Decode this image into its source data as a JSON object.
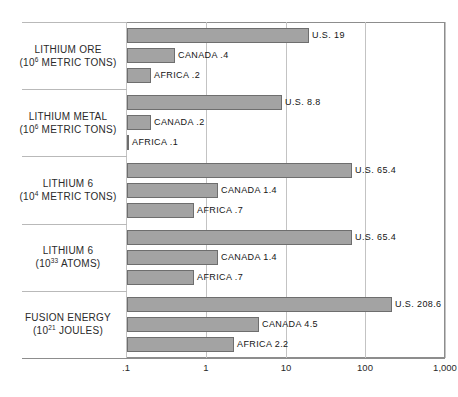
{
  "chart_data": {
    "type": "bar",
    "orientation": "horizontal",
    "title": "",
    "xlabel": "",
    "ylabel": "",
    "xscale": "log",
    "xlim": [
      0.1,
      1000
    ],
    "xticks": [
      0.1,
      1,
      10,
      100,
      1000
    ],
    "xticklabels": [
      ".1",
      "1",
      "10",
      "100",
      "1,000"
    ],
    "grid": true,
    "legend": "none",
    "bar_color": "#a3a3a3",
    "bar_edge_color": "#6e6e6e",
    "groups": [
      {
        "label_line1": "LITHIUM ORE",
        "label_line2_pre": "(10",
        "label_line2_sup": "6",
        "label_line2_post": " METRIC TONS)",
        "bars": [
          {
            "name": "U.S.",
            "value": 19,
            "label": "U.S. 19"
          },
          {
            "name": "CANADA",
            "value": 0.4,
            "label": "CANADA .4"
          },
          {
            "name": "AFRICA",
            "value": 0.2,
            "label": "AFRICA .2"
          }
        ]
      },
      {
        "label_line1": "LITHIUM METAL",
        "label_line2_pre": "(10",
        "label_line2_sup": "6",
        "label_line2_post": " METRIC TONS)",
        "bars": [
          {
            "name": "U.S.",
            "value": 8.8,
            "label": "U.S. 8.8"
          },
          {
            "name": "CANADA",
            "value": 0.2,
            "label": "CANADA .2"
          },
          {
            "name": "AFRICA",
            "value": 0.1,
            "label": "AFRICA .1"
          }
        ]
      },
      {
        "label_line1": "LITHIUM 6",
        "label_line2_pre": "(10",
        "label_line2_sup": "4",
        "label_line2_post": " METRIC TONS)",
        "bars": [
          {
            "name": "U.S.",
            "value": 65.4,
            "label": "U.S. 65.4"
          },
          {
            "name": "CANADA",
            "value": 1.4,
            "label": "CANADA 1.4"
          },
          {
            "name": "AFRICA",
            "value": 0.7,
            "label": "AFRICA .7"
          }
        ]
      },
      {
        "label_line1": "LITHIUM 6",
        "label_line2_pre": "(10",
        "label_line2_sup": "33",
        "label_line2_post": " ATOMS)",
        "bars": [
          {
            "name": "U.S.",
            "value": 65.4,
            "label": "U.S. 65.4"
          },
          {
            "name": "CANADA",
            "value": 1.4,
            "label": "CANADA 1.4"
          },
          {
            "name": "AFRICA",
            "value": 0.7,
            "label": "AFRICA .7"
          }
        ]
      },
      {
        "label_line1": "FUSION ENERGY",
        "label_line2_pre": "(10",
        "label_line2_sup": "21",
        "label_line2_post": " JOULES)",
        "bars": [
          {
            "name": "U.S.",
            "value": 208.6,
            "label": "U.S. 208.6"
          },
          {
            "name": "CANADA",
            "value": 4.5,
            "label": "CANADA 4.5"
          },
          {
            "name": "AFRICA",
            "value": 2.2,
            "label": "AFRICA 2.2"
          }
        ]
      }
    ]
  },
  "bottom_caption": ""
}
